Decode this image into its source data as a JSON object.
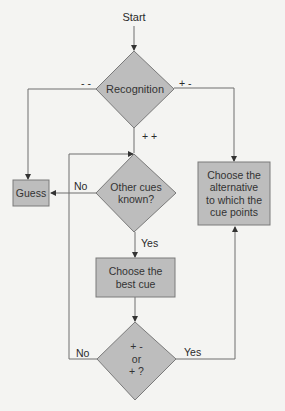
{
  "diagram": {
    "start_label": "Start",
    "nodes": {
      "recognition": "Recognition",
      "guess": "Guess",
      "other_cues": [
        "Other cues",
        "known?"
      ],
      "choose_alternative": [
        "Choose the",
        "alternative",
        "to which the",
        "cue points"
      ],
      "best_cue": [
        "Choose the",
        "best cue"
      ],
      "check": [
        "+ -",
        "or",
        "+ ?"
      ]
    },
    "edge_labels": {
      "minus_minus": "- -",
      "plus_minus": "+ -",
      "plus_plus": "+ +",
      "no_other_cues": "No",
      "yes_other_cues": "Yes",
      "no_check": "No",
      "yes_check": "Yes"
    },
    "colors": {
      "node_fill": "#bdbdbd",
      "stroke": "#6e6e6e",
      "background": "#f4f4f2"
    }
  }
}
